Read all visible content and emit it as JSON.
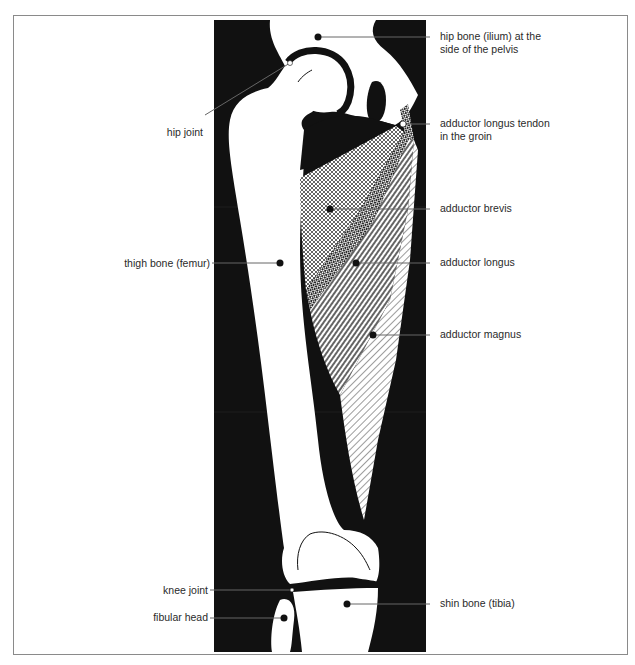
{
  "diagram": {
    "colors": {
      "background": "#ffffff",
      "panel": "#111111",
      "bone": "#ffffff",
      "leader": "#555555",
      "frame": "#8a8a8a"
    },
    "labels_left": [
      {
        "id": "hip-joint",
        "text": "hip joint"
      },
      {
        "id": "thigh-bone",
        "text": "thigh bone (femur)"
      },
      {
        "id": "knee-joint",
        "text": "knee joint"
      },
      {
        "id": "fibular-head",
        "text": "fibular head"
      }
    ],
    "labels_right": [
      {
        "id": "hip-bone",
        "line1": "hip bone  (ilium)  at the",
        "line2": "side of the pelvis"
      },
      {
        "id": "adductor-longus-tendon",
        "line1": "adductor longus tendon",
        "line2": "in the groin"
      },
      {
        "id": "adductor-brevis",
        "text": "adductor brevis"
      },
      {
        "id": "adductor-longus",
        "text": "adductor longus"
      },
      {
        "id": "adductor-magnus",
        "text": "adductor magnus"
      },
      {
        "id": "shin-bone",
        "text": "shin bone (tibia)"
      }
    ]
  }
}
